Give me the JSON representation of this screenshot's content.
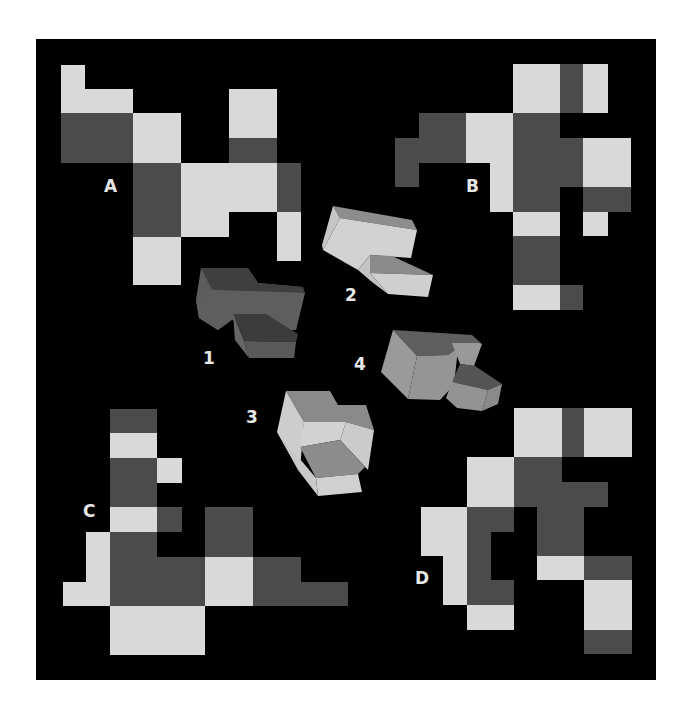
{
  "colors": {
    "background": "#ffffff",
    "panel": "#000000",
    "light": "#d9d9d9",
    "dark": "#4b4b4b",
    "label": "#e6e6e6"
  },
  "nets": [
    {
      "id": "A",
      "label": "A",
      "label_pos": [
        104,
        178
      ],
      "rects": [
        {
          "x": 61,
          "y": 65,
          "w": 24,
          "h": 48,
          "tone": "light"
        },
        {
          "x": 85,
          "y": 89,
          "w": 48,
          "h": 24,
          "tone": "light"
        },
        {
          "x": 61,
          "y": 113,
          "w": 72,
          "h": 50,
          "tone": "dark"
        },
        {
          "x": 133,
          "y": 113,
          "w": 48,
          "h": 50,
          "tone": "light"
        },
        {
          "x": 229,
          "y": 89,
          "w": 48,
          "h": 49,
          "tone": "light"
        },
        {
          "x": 229,
          "y": 138,
          "w": 48,
          "h": 25,
          "tone": "dark"
        },
        {
          "x": 133,
          "y": 163,
          "w": 48,
          "h": 74,
          "tone": "dark"
        },
        {
          "x": 181,
          "y": 163,
          "w": 96,
          "h": 49,
          "tone": "light"
        },
        {
          "x": 181,
          "y": 212,
          "w": 48,
          "h": 25,
          "tone": "light"
        },
        {
          "x": 277,
          "y": 163,
          "w": 24,
          "h": 49,
          "tone": "dark"
        },
        {
          "x": 277,
          "y": 212,
          "w": 24,
          "h": 49,
          "tone": "light"
        },
        {
          "x": 133,
          "y": 237,
          "w": 48,
          "h": 48,
          "tone": "light"
        }
      ]
    },
    {
      "id": "B",
      "label": "B",
      "label_pos": [
        466,
        178
      ],
      "rects": [
        {
          "x": 513,
          "y": 64,
          "w": 47,
          "h": 49,
          "tone": "light"
        },
        {
          "x": 560,
          "y": 64,
          "w": 23,
          "h": 49,
          "tone": "dark"
        },
        {
          "x": 583,
          "y": 64,
          "w": 25,
          "h": 49,
          "tone": "light"
        },
        {
          "x": 419,
          "y": 113,
          "w": 47,
          "h": 50,
          "tone": "dark"
        },
        {
          "x": 395,
          "y": 138,
          "w": 24,
          "h": 49,
          "tone": "dark"
        },
        {
          "x": 466,
          "y": 113,
          "w": 47,
          "h": 50,
          "tone": "light"
        },
        {
          "x": 490,
          "y": 163,
          "w": 23,
          "h": 49,
          "tone": "light"
        },
        {
          "x": 513,
          "y": 113,
          "w": 47,
          "h": 99,
          "tone": "dark"
        },
        {
          "x": 560,
          "y": 138,
          "w": 23,
          "h": 49,
          "tone": "dark"
        },
        {
          "x": 583,
          "y": 138,
          "w": 48,
          "h": 49,
          "tone": "light"
        },
        {
          "x": 583,
          "y": 187,
          "w": 48,
          "h": 25,
          "tone": "dark"
        },
        {
          "x": 583,
          "y": 212,
          "w": 25,
          "h": 24,
          "tone": "light"
        },
        {
          "x": 513,
          "y": 212,
          "w": 47,
          "h": 24,
          "tone": "light"
        },
        {
          "x": 513,
          "y": 236,
          "w": 47,
          "h": 49,
          "tone": "dark"
        },
        {
          "x": 513,
          "y": 285,
          "w": 47,
          "h": 25,
          "tone": "light"
        },
        {
          "x": 560,
          "y": 285,
          "w": 23,
          "h": 25,
          "tone": "dark"
        }
      ]
    },
    {
      "id": "C",
      "label": "C",
      "label_pos": [
        83,
        503
      ],
      "rects": [
        {
          "x": 110,
          "y": 409,
          "w": 47,
          "h": 24,
          "tone": "dark"
        },
        {
          "x": 110,
          "y": 433,
          "w": 47,
          "h": 25,
          "tone": "light"
        },
        {
          "x": 110,
          "y": 458,
          "w": 47,
          "h": 49,
          "tone": "dark"
        },
        {
          "x": 157,
          "y": 458,
          "w": 25,
          "h": 25,
          "tone": "light"
        },
        {
          "x": 110,
          "y": 507,
          "w": 47,
          "h": 25,
          "tone": "light"
        },
        {
          "x": 157,
          "y": 507,
          "w": 25,
          "h": 25,
          "tone": "dark"
        },
        {
          "x": 86,
          "y": 532,
          "w": 24,
          "h": 74,
          "tone": "light"
        },
        {
          "x": 63,
          "y": 582,
          "w": 23,
          "h": 24,
          "tone": "light"
        },
        {
          "x": 110,
          "y": 532,
          "w": 47,
          "h": 74,
          "tone": "dark"
        },
        {
          "x": 157,
          "y": 557,
          "w": 48,
          "h": 49,
          "tone": "dark"
        },
        {
          "x": 205,
          "y": 507,
          "w": 48,
          "h": 50,
          "tone": "dark"
        },
        {
          "x": 205,
          "y": 557,
          "w": 48,
          "h": 49,
          "tone": "light"
        },
        {
          "x": 253,
          "y": 557,
          "w": 48,
          "h": 49,
          "tone": "dark"
        },
        {
          "x": 301,
          "y": 582,
          "w": 47,
          "h": 24,
          "tone": "dark"
        },
        {
          "x": 110,
          "y": 606,
          "w": 95,
          "h": 49,
          "tone": "light"
        }
      ]
    },
    {
      "id": "D",
      "label": "D",
      "label_pos": [
        415,
        570
      ],
      "rects": [
        {
          "x": 514,
          "y": 408,
          "w": 48,
          "h": 49,
          "tone": "light"
        },
        {
          "x": 562,
          "y": 408,
          "w": 22,
          "h": 49,
          "tone": "dark"
        },
        {
          "x": 584,
          "y": 408,
          "w": 48,
          "h": 49,
          "tone": "light"
        },
        {
          "x": 467,
          "y": 457,
          "w": 47,
          "h": 50,
          "tone": "light"
        },
        {
          "x": 514,
          "y": 457,
          "w": 48,
          "h": 50,
          "tone": "dark"
        },
        {
          "x": 562,
          "y": 482,
          "w": 46,
          "h": 25,
          "tone": "dark"
        },
        {
          "x": 537,
          "y": 507,
          "w": 47,
          "h": 49,
          "tone": "dark"
        },
        {
          "x": 421,
          "y": 507,
          "w": 46,
          "h": 49,
          "tone": "light"
        },
        {
          "x": 443,
          "y": 556,
          "w": 24,
          "h": 49,
          "tone": "light"
        },
        {
          "x": 467,
          "y": 507,
          "w": 47,
          "h": 25,
          "tone": "dark"
        },
        {
          "x": 467,
          "y": 532,
          "w": 24,
          "h": 48,
          "tone": "dark"
        },
        {
          "x": 467,
          "y": 580,
          "w": 47,
          "h": 25,
          "tone": "dark"
        },
        {
          "x": 467,
          "y": 605,
          "w": 47,
          "h": 25,
          "tone": "light"
        },
        {
          "x": 537,
          "y": 556,
          "w": 47,
          "h": 24,
          "tone": "light"
        },
        {
          "x": 584,
          "y": 556,
          "w": 48,
          "h": 24,
          "tone": "dark"
        },
        {
          "x": 584,
          "y": 580,
          "w": 48,
          "h": 50,
          "tone": "light"
        },
        {
          "x": 584,
          "y": 630,
          "w": 48,
          "h": 24,
          "tone": "dark"
        }
      ]
    }
  ],
  "solids": [
    {
      "id": "1",
      "label": "1",
      "label_pos": [
        203,
        350
      ],
      "faces": [
        {
          "points": "201,268 248,268 258,283 303,287 296,330 262,330 232,320 218,330 199,318 196,300",
          "fill": "#5c5c5c"
        },
        {
          "points": "201,268 248,268 258,283 303,287 305,293 212,290",
          "fill": "#3f3f3f"
        },
        {
          "points": "212,290 305,293 296,330 262,330 236,316 218,330 199,318 196,300",
          "fill": "#5e5e5e"
        },
        {
          "points": "233,314 266,314 298,334 296,342 244,341",
          "fill": "#3c3c3c"
        },
        {
          "points": "244,341 296,342 294,358 249,358",
          "fill": "#5a5a5a"
        },
        {
          "points": "233,314 244,341 249,358 235,340",
          "fill": "#666666"
        }
      ]
    },
    {
      "id": "2",
      "label": "2",
      "label_pos": [
        345,
        287
      ],
      "faces": [
        {
          "points": "333,206 412,220 417,230 340,218",
          "fill": "#8d8d8d"
        },
        {
          "points": "340,218 417,230 411,258 370,255 358,270 323,250",
          "fill": "#d2d2d2"
        },
        {
          "points": "333,206 340,218 323,250 322,245",
          "fill": "#c6c6c6"
        },
        {
          "points": "370,255 392,256 433,275 370,273",
          "fill": "#8a8a8a"
        },
        {
          "points": "370,273 433,275 428,297 388,294",
          "fill": "#cfcfcf"
        },
        {
          "points": "358,270 370,255 370,273 388,294 372,282",
          "fill": "#c4c4c4"
        }
      ]
    },
    {
      "id": "3",
      "label": "3",
      "label_pos": [
        246,
        409
      ],
      "faces": [
        {
          "points": "286,391 330,391 338,405 366,405 374,430 346,422 304,422",
          "fill": "#8a8a8a"
        },
        {
          "points": "286,391 304,422 300,470 277,432",
          "fill": "#cdcdcd"
        },
        {
          "points": "304,422 346,422 340,440 300,447",
          "fill": "#d3d3d3"
        },
        {
          "points": "346,422 374,430 368,470 340,440",
          "fill": "#cbcbcb"
        },
        {
          "points": "300,447 340,440 365,467 358,474 316,478",
          "fill": "#8c8c8c"
        },
        {
          "points": "277,432 316,478 318,496 298,470",
          "fill": "#c9c9c9"
        },
        {
          "points": "316,478 358,474 362,492 318,496",
          "fill": "#d0d0d0"
        }
      ]
    },
    {
      "id": "4",
      "label": "4",
      "label_pos": [
        354,
        356
      ],
      "faces": [
        {
          "points": "393,330 472,335 482,344 462,346 448,355 417,356",
          "fill": "#5f5f5f"
        },
        {
          "points": "393,330 417,356 408,399 381,372",
          "fill": "#9a9a9a"
        },
        {
          "points": "417,356 448,355 458,348 454,385 440,400 408,399",
          "fill": "#959595"
        },
        {
          "points": "452,343 478,343 482,344 474,366 460,364",
          "fill": "#999999"
        },
        {
          "points": "460,364 475,366 502,384 488,390 452,382",
          "fill": "#555555"
        },
        {
          "points": "452,382 488,390 482,411 457,408 446,398",
          "fill": "#939393"
        },
        {
          "points": "488,390 502,384 498,404 482,411",
          "fill": "#8a8a8a"
        }
      ]
    }
  ]
}
